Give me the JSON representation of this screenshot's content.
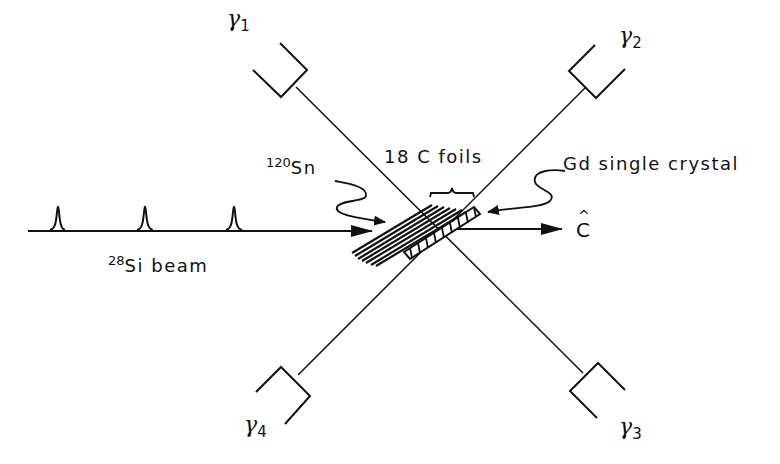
{
  "diagram": {
    "detectors": [
      {
        "id": "gamma-1",
        "symbol": "γ",
        "subscript": "1"
      },
      {
        "id": "gamma-2",
        "symbol": "γ",
        "subscript": "2"
      },
      {
        "id": "gamma-3",
        "symbol": "γ",
        "subscript": "3"
      },
      {
        "id": "gamma-4",
        "symbol": "γ",
        "subscript": "4"
      }
    ],
    "labels": {
      "target_mass": "120",
      "target_element": "Sn",
      "foils": "18 C foils",
      "crystal": "Gd single crystal",
      "axis_hat": "^",
      "axis": "C",
      "beam_mass": "28",
      "beam_element": "Si",
      "beam_word": "beam"
    },
    "beam_pulses": 3,
    "line_color": "#111111",
    "background": "#ffffff"
  }
}
